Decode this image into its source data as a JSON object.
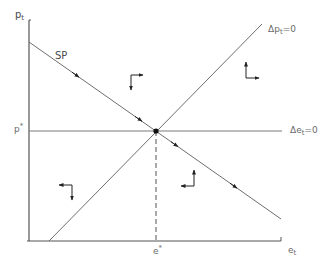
{
  "diagram": {
    "type": "phase-diagram",
    "axes": {
      "y_label": "p",
      "y_label_sub": "t",
      "x_label": "e",
      "x_label_sub": "t"
    },
    "equilibrium": {
      "p_label": "p",
      "p_label_sup": "*",
      "e_label": "e",
      "e_label_sup": "*"
    },
    "curves": {
      "saddle_path": {
        "label": "SP"
      },
      "dp_zero": {
        "label_prefix": "Δp",
        "label_sub": "t",
        "label_suffix": "=0"
      },
      "de_zero": {
        "label_prefix": "Δe",
        "label_sub": "t",
        "label_suffix": "=0"
      }
    },
    "regions": [
      {
        "name": "upper-middle",
        "arrows": [
          "right",
          "down"
        ]
      },
      {
        "name": "upper-right",
        "arrows": [
          "up",
          "right"
        ]
      },
      {
        "name": "lower-left",
        "arrows": [
          "left",
          "down"
        ]
      },
      {
        "name": "lower-middle",
        "arrows": [
          "up",
          "left"
        ]
      }
    ],
    "colors": {
      "line": "#6e6e6e",
      "axis": "#555555",
      "arrow": "#222222",
      "point": "#111111",
      "text": "#4a4a4a"
    }
  }
}
